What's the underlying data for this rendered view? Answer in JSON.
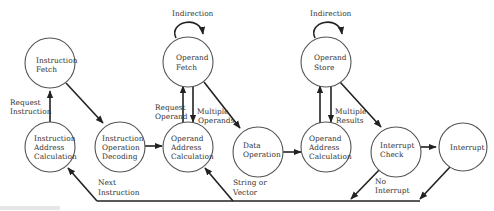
{
  "diagram": {
    "type": "state-diagram",
    "nodes": [
      {
        "id": "iac",
        "lines": [
          "Instruction",
          "Address",
          "Calculation"
        ]
      },
      {
        "id": "if",
        "lines": [
          "Instruction",
          "Fetch"
        ]
      },
      {
        "id": "iod",
        "lines": [
          "Instruction",
          "Operation",
          "Decoding"
        ]
      },
      {
        "id": "oac1",
        "lines": [
          "Operand",
          "Address",
          "Calculation"
        ]
      },
      {
        "id": "of",
        "lines": [
          "Operand",
          "Fetch"
        ]
      },
      {
        "id": "do",
        "lines": [
          "Data",
          "Operation"
        ]
      },
      {
        "id": "oac2",
        "lines": [
          "Operand",
          "Address",
          "Calculation"
        ]
      },
      {
        "id": "os",
        "lines": [
          "Operand",
          "Store"
        ]
      },
      {
        "id": "ic",
        "lines": [
          "Interrupt",
          "Check"
        ]
      },
      {
        "id": "int",
        "lines": [
          "Interrupt"
        ]
      }
    ],
    "edge_labels": {
      "request_instruction": [
        "Request",
        "Instruction"
      ],
      "request_operand": [
        "Request",
        "Operand"
      ],
      "multiple_operands": [
        "Multiple",
        "Operands"
      ],
      "multiple_results": [
        "Multiple",
        "Results"
      ],
      "indirection_fetch": "Indirection",
      "indirection_store": "Indirection",
      "next_instruction": [
        "Next",
        "Instruction"
      ],
      "string_or_vector": [
        "String or",
        "Vector"
      ],
      "no_interrupt": [
        "No",
        "Interrupt"
      ]
    },
    "edges": [
      {
        "from": "iac",
        "to": "if",
        "label": "Request Instruction"
      },
      {
        "from": "if",
        "to": "iod"
      },
      {
        "from": "iod",
        "to": "oac1"
      },
      {
        "from": "oac1",
        "to": "of",
        "label": "Request Operand"
      },
      {
        "from": "of",
        "to": "oac1",
        "label": "Multiple Operands"
      },
      {
        "from": "of",
        "to": "of",
        "label": "Indirection"
      },
      {
        "from": "of",
        "to": "do"
      },
      {
        "from": "do",
        "to": "oac2"
      },
      {
        "from": "oac2",
        "to": "os"
      },
      {
        "from": "os",
        "to": "oac2",
        "label": "Multiple Results"
      },
      {
        "from": "os",
        "to": "os",
        "label": "Indirection"
      },
      {
        "from": "os",
        "to": "ic"
      },
      {
        "from": "ic",
        "to": "int"
      },
      {
        "from": "ic",
        "to": "iac",
        "label": "No Interrupt / Next Instruction"
      },
      {
        "from": "int",
        "to": "iac"
      },
      {
        "from": "do",
        "to": "oac1",
        "label": "String or Vector"
      }
    ]
  }
}
